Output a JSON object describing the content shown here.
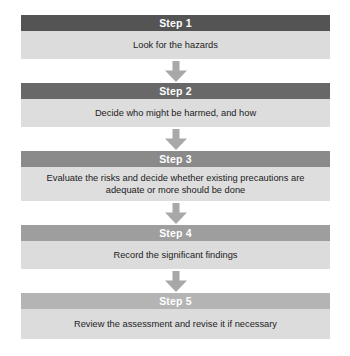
{
  "diagram": {
    "orientation": "vertical-top-down",
    "connector_icon": "down-arrow-icon",
    "colors": {
      "page_background": "#ffffff",
      "body_panel": "#dcdcdc",
      "body_panel_alt": "#d9d9d9",
      "arrow": "#a8a8a8",
      "header_text": "#ffffff",
      "body_text": "#1c1c1c"
    },
    "steps": [
      {
        "header": "Step 1",
        "body": "Look for the hazards",
        "header_color": "#545454",
        "body_color": "#dcdcdc",
        "body_height": 28
      },
      {
        "header": "Step 2",
        "body": "Decide who might be harmed, and how",
        "header_color": "#686868",
        "body_color": "#dddddd",
        "body_height": 28
      },
      {
        "header": "Step 3",
        "body": "Evaluate the risks and decide whether existing precautions are adequate or more should be done",
        "header_color": "#8a8a8a",
        "body_color": "#dedede",
        "body_height": 34
      },
      {
        "header": "Step 4",
        "body": "Record the significant findings",
        "header_color": "#9e9e9e",
        "body_color": "#dcdcdc",
        "body_height": 28
      },
      {
        "header": "Step 5",
        "body": "Review the assessment and revise it if necessary",
        "header_color": "#b4b4b4",
        "body_color": "#dcdcdc",
        "body_height": 30
      }
    ]
  }
}
